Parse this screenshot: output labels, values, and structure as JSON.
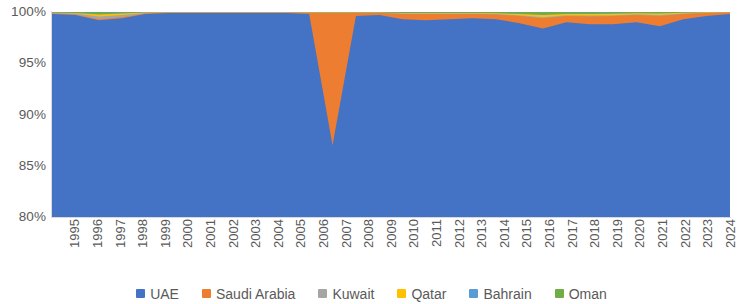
{
  "chart_data": {
    "type": "area",
    "stacked": true,
    "normalized_percent": true,
    "title": "",
    "subtitle": "",
    "xlabel": "",
    "ylabel": "",
    "grid": false,
    "legend_position": "bottom",
    "ylim": [
      80,
      100
    ],
    "ytick_labels": [
      "100%",
      "95%",
      "90%",
      "85%",
      "80%"
    ],
    "ytick_values": [
      100,
      95,
      90,
      85,
      80
    ],
    "categories": [
      "1995",
      "1996",
      "1997",
      "1998",
      "1999",
      "2000",
      "2001",
      "2002",
      "2003",
      "2004",
      "2005",
      "2006",
      "2007",
      "2008",
      "2009",
      "2010",
      "2011",
      "2012",
      "2013",
      "2014",
      "2015",
      "2016",
      "2017",
      "2018",
      "2019",
      "2020",
      "2021",
      "2022",
      "2023",
      "2024"
    ],
    "series": [
      {
        "name": "UAE",
        "color": "#4472C4",
        "values": [
          99.8,
          99.7,
          99.2,
          99.4,
          99.8,
          99.9,
          99.9,
          99.9,
          99.9,
          99.9,
          99.9,
          99.8,
          87.0,
          99.6,
          99.7,
          99.3,
          99.2,
          99.3,
          99.4,
          99.3,
          98.9,
          98.4,
          99.0,
          98.8,
          98.8,
          99.0,
          98.6,
          99.3,
          99.6,
          99.8
        ]
      },
      {
        "name": "Saudi Arabia",
        "color": "#ED7D31",
        "values": [
          0.05,
          0.05,
          0.1,
          0.1,
          0.05,
          0.03,
          0.03,
          0.03,
          0.03,
          0.03,
          0.03,
          0.1,
          12.9,
          0.3,
          0.2,
          0.5,
          0.6,
          0.5,
          0.4,
          0.45,
          0.7,
          1.0,
          0.6,
          0.75,
          0.8,
          0.7,
          1.0,
          0.5,
          0.3,
          0.15
        ]
      },
      {
        "name": "Kuwait",
        "color": "#A5A5A5",
        "values": [
          0.05,
          0.1,
          0.25,
          0.2,
          0.05,
          0.02,
          0.02,
          0.02,
          0.02,
          0.02,
          0.02,
          0.02,
          0.02,
          0.02,
          0.02,
          0.05,
          0.05,
          0.05,
          0.05,
          0.05,
          0.08,
          0.1,
          0.08,
          0.1,
          0.08,
          0.08,
          0.1,
          0.05,
          0.03,
          0.02
        ]
      },
      {
        "name": "Qatar",
        "color": "#FFC000",
        "values": [
          0.03,
          0.05,
          0.2,
          0.15,
          0.05,
          0.02,
          0.02,
          0.02,
          0.02,
          0.02,
          0.02,
          0.03,
          0.03,
          0.03,
          0.03,
          0.05,
          0.05,
          0.05,
          0.05,
          0.08,
          0.12,
          0.2,
          0.12,
          0.15,
          0.15,
          0.1,
          0.15,
          0.08,
          0.04,
          0.02
        ]
      },
      {
        "name": "Bahrain",
        "color": "#5B9BD5",
        "values": [
          0.02,
          0.03,
          0.05,
          0.05,
          0.02,
          0.01,
          0.01,
          0.01,
          0.01,
          0.01,
          0.01,
          0.01,
          0.01,
          0.01,
          0.01,
          0.02,
          0.02,
          0.02,
          0.02,
          0.02,
          0.03,
          0.05,
          0.03,
          0.04,
          0.04,
          0.03,
          0.04,
          0.02,
          0.01,
          0.01
        ]
      },
      {
        "name": "Oman",
        "color": "#70AD47",
        "values": [
          0.05,
          0.07,
          0.2,
          0.1,
          0.03,
          0.02,
          0.02,
          0.02,
          0.02,
          0.02,
          0.02,
          0.04,
          0.04,
          0.04,
          0.04,
          0.08,
          0.08,
          0.08,
          0.08,
          0.1,
          0.17,
          0.25,
          0.17,
          0.16,
          0.13,
          0.09,
          0.11,
          0.05,
          0.02,
          0.0
        ]
      }
    ]
  },
  "legend": {
    "items": [
      {
        "label": "UAE",
        "color": "#4472C4",
        "icon": "legend-swatch-square"
      },
      {
        "label": "Saudi Arabia",
        "color": "#ED7D31",
        "icon": "legend-swatch-square"
      },
      {
        "label": "Kuwait",
        "color": "#A5A5A5",
        "icon": "legend-swatch-square"
      },
      {
        "label": "Qatar",
        "color": "#FFC000",
        "icon": "legend-swatch-square"
      },
      {
        "label": "Bahrain",
        "color": "#5B9BD5",
        "icon": "legend-swatch-square"
      },
      {
        "label": "Oman",
        "color": "#70AD47",
        "icon": "legend-swatch-square"
      }
    ]
  },
  "axes": {
    "y_axis_color": "#d9d9d9",
    "x_axis_color": "#d9d9d9",
    "tick_text_color": "#5a5a5a"
  }
}
